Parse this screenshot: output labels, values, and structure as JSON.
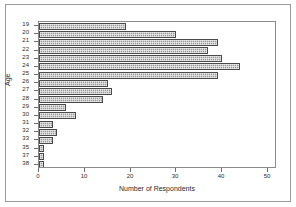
{
  "chart_data": {
    "type": "bar",
    "orientation": "horizontal",
    "title": "",
    "xlabel": "Number of Respondents",
    "ylabel": "Age",
    "categories": [
      "19",
      "20",
      "21",
      "22",
      "23",
      "24",
      "25",
      "26",
      "27",
      "28",
      "29",
      "30",
      "31",
      "32",
      "33",
      "35",
      "37",
      "38"
    ],
    "values": [
      19,
      30,
      39,
      37,
      40,
      44,
      39,
      15,
      16,
      14,
      6,
      8,
      3,
      4,
      3,
      1,
      1,
      1
    ],
    "xlim": [
      0,
      52
    ],
    "xticks": [
      0,
      10,
      20,
      30,
      40,
      50
    ],
    "xticklabels": [
      "0",
      "10",
      "20",
      "30",
      "40",
      "50"
    ],
    "grid": false,
    "legend": null,
    "bar_fill_color": "#9b9b9b",
    "bar_edge_color": "#4a4a4a",
    "axis_color": "#8b8b8b",
    "frame_color": "#9a9a9a",
    "background_color": "#ffffff"
  }
}
